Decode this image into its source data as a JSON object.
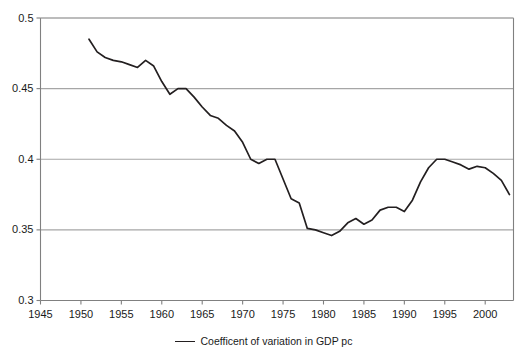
{
  "chart_data": {
    "type": "line",
    "title": "",
    "subtitle": "",
    "xlabel": "",
    "ylabel": "",
    "xlim": [
      1945,
      2003.5
    ],
    "ylim": [
      0.3,
      0.5
    ],
    "grid": true,
    "legend_position": "bottom-center",
    "xticks": [
      "1945",
      "1950",
      "1955",
      "1960",
      "1965",
      "1970",
      "1975",
      "1980",
      "1985",
      "1990",
      "1995",
      "2000"
    ],
    "xtick_values": [
      1945,
      1950,
      1955,
      1960,
      1965,
      1970,
      1975,
      1980,
      1985,
      1990,
      1995,
      2000
    ],
    "yticks": [
      "0.3",
      "0.35",
      "0.4",
      "0.45",
      "0.5"
    ],
    "ytick_values": [
      0.3,
      0.35,
      0.4,
      0.45,
      0.5
    ],
    "series": [
      {
        "name": "Coefficent of variation in GDP pc",
        "color": "#231f20",
        "x": [
          1951,
          1952,
          1953,
          1954,
          1955,
          1956,
          1957,
          1958,
          1959,
          1960,
          1961,
          1962,
          1963,
          1964,
          1965,
          1966,
          1967,
          1968,
          1969,
          1970,
          1971,
          1972,
          1973,
          1974,
          1975,
          1976,
          1977,
          1978,
          1979,
          1980,
          1981,
          1982,
          1983,
          1984,
          1985,
          1986,
          1987,
          1988,
          1989,
          1990,
          1991,
          1992,
          1993,
          1994,
          1995,
          1996,
          1997,
          1998,
          1999,
          2000,
          2001,
          2002,
          2003
        ],
        "values": [
          0.485,
          0.476,
          0.472,
          0.47,
          0.469,
          0.467,
          0.465,
          0.47,
          0.466,
          0.455,
          0.446,
          0.45,
          0.45,
          0.444,
          0.437,
          0.431,
          0.429,
          0.424,
          0.42,
          0.412,
          0.4,
          0.397,
          0.4,
          0.4,
          0.386,
          0.372,
          0.369,
          0.351,
          0.35,
          0.348,
          0.346,
          0.349,
          0.355,
          0.358,
          0.354,
          0.357,
          0.364,
          0.366,
          0.366,
          0.363,
          0.371,
          0.384,
          0.394,
          0.4,
          0.4,
          0.398,
          0.396,
          0.393,
          0.395,
          0.394,
          0.39,
          0.385,
          0.375
        ]
      }
    ]
  },
  "legend": {
    "entries": [
      {
        "label": "Coefficent of variation in GDP pc",
        "color": "#231f20"
      }
    ]
  },
  "axes": {
    "gridline_color": "#a6a6a6",
    "frame_color": "#808080"
  }
}
